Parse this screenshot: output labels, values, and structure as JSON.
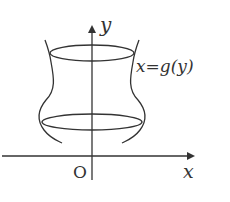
{
  "diagram": {
    "type": "surface-of-revolution",
    "axes": {
      "x_label": "x",
      "y_label": "y",
      "origin_label": "O"
    },
    "curve_label": "x=g(y)",
    "colors": {
      "stroke": "#333333",
      "background": "#ffffff"
    }
  }
}
